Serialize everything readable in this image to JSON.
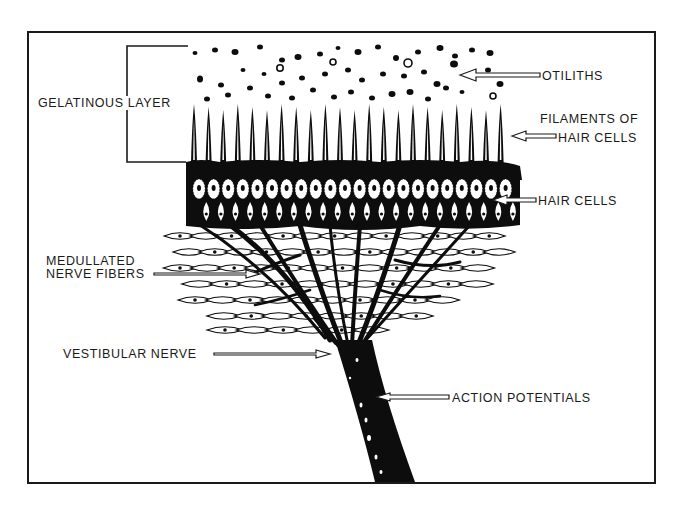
{
  "diagram": {
    "border_color": "#1a1a1a",
    "ink_color": "#0d0d0d",
    "background": "#ffffff"
  },
  "labels": {
    "gelatinous_layer": "GELATINOUS LAYER",
    "otiliths": "OTILITHS",
    "filaments_line1": "FILAMENTS OF",
    "filaments_line2": "HAIR CELLS",
    "hair_cells": "HAIR CELLS",
    "medullated_line1": "MEDULLATED",
    "medullated_line2": "NERVE FIBERS",
    "vestibular_nerve": "VESTIBULAR NERVE",
    "action_potentials": "ACTION POTENTIALS"
  },
  "structures": [
    {
      "name": "otiliths",
      "description": "scattered dark granules above the hair filaments"
    },
    {
      "name": "gelatinous-layer",
      "description": "bracketed region containing otoliths and filaments"
    },
    {
      "name": "filaments-of-hair-cells",
      "description": "row of tall spike-shaped cilia"
    },
    {
      "name": "hair-cells",
      "description": "row of oval cells with nuclei"
    },
    {
      "name": "medullated-nerve-fibers",
      "description": "branching fibers among leaf-shaped supporting cells"
    },
    {
      "name": "vestibular-nerve",
      "description": "converging trunk of fibers"
    },
    {
      "name": "action-potentials",
      "description": "white marks along dark nerve trunk"
    }
  ]
}
